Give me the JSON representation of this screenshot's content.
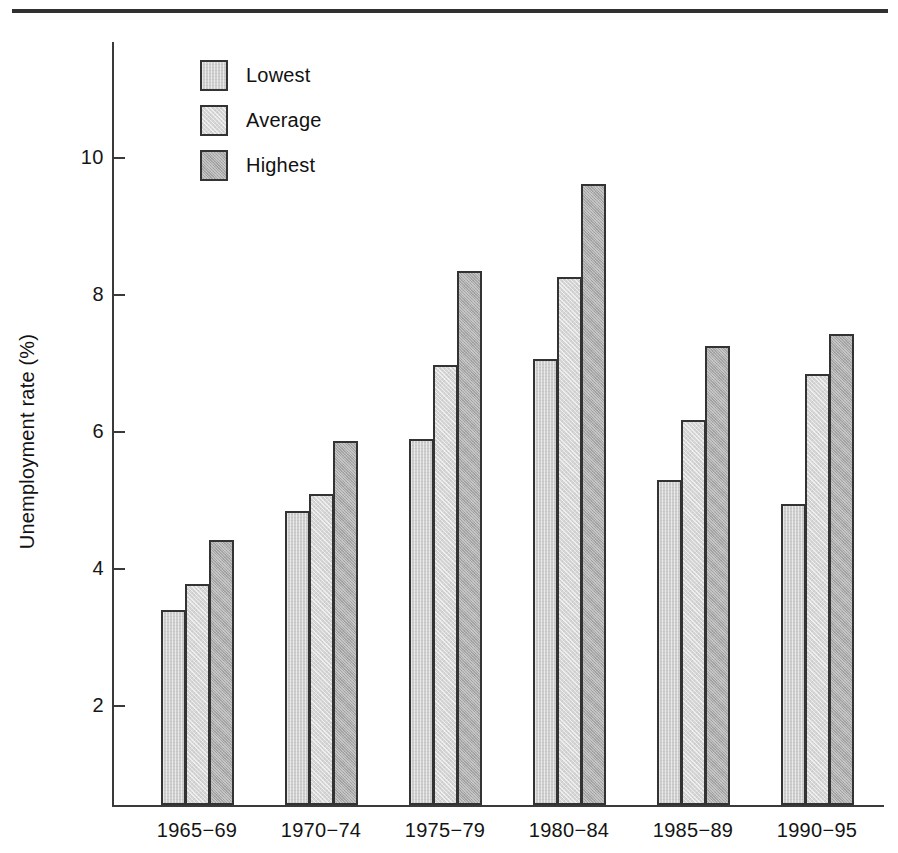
{
  "chart_data": {
    "type": "bar",
    "title": "",
    "subtitle": "",
    "xlabel": "",
    "ylabel": "Unemployment rate (%)",
    "categories": [
      "1965−69",
      "1970−74",
      "1975−79",
      "1980−84",
      "1985−89",
      "1990−95"
    ],
    "series": [
      {
        "name": "Lowest",
        "color": "#cfcfcf",
        "values": [
          3.4,
          4.85,
          5.9,
          7.07,
          5.3,
          4.95
        ]
      },
      {
        "name": "Average",
        "color": "#d6d6d6",
        "values": [
          3.78,
          5.1,
          6.98,
          8.27,
          6.17,
          6.85
        ]
      },
      {
        "name": "Highest",
        "color": "#ababab",
        "values": [
          4.43,
          5.87,
          8.35,
          9.62,
          7.25,
          7.43
        ]
      }
    ],
    "ylim": [
      0.6,
      11.6
    ],
    "yticks": [
      2,
      4,
      6,
      8,
      10
    ],
    "ytick_labels": [
      "2",
      "4",
      "6",
      "8",
      "10"
    ],
    "grid": false,
    "legend_position": "top-left",
    "legend_entries": [
      "Lowest",
      "Average",
      "Highest"
    ],
    "annotations": []
  },
  "figure": {
    "axis_color": "#3a3a3a",
    "bar_edge_color": "#333333",
    "rule_color": "#303030",
    "background": "#ffffff"
  }
}
